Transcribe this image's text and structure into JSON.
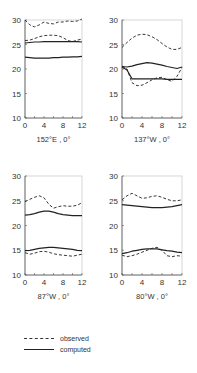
{
  "chart_data": [
    {
      "type": "line",
      "title": "152°E , 0°",
      "xlabel": "",
      "ylabel": "",
      "xlim": [
        0,
        12
      ],
      "ylim": [
        10,
        30
      ],
      "xticks": [
        0,
        4,
        8,
        12
      ],
      "yticks": [
        10,
        15,
        20,
        25,
        30
      ],
      "x": [
        0,
        1,
        2,
        3,
        4,
        5,
        6,
        7,
        8,
        9,
        10,
        11,
        12
      ],
      "series": [
        {
          "name": "observed",
          "style": "dashed",
          "values": [
            30.0,
            29.0,
            28.6,
            29.0,
            29.6,
            29.3,
            29.2,
            29.6,
            29.6,
            29.8,
            29.7,
            29.8,
            30.2
          ]
        },
        {
          "name": "observed",
          "style": "dashed",
          "values": [
            25.8,
            25.9,
            26.2,
            26.6,
            26.8,
            26.9,
            26.9,
            26.8,
            26.4,
            25.8,
            25.6,
            25.9,
            26.1
          ]
        },
        {
          "name": "computed",
          "style": "solid",
          "values": [
            25.3,
            25.4,
            25.5,
            25.5,
            25.6,
            25.6,
            25.6,
            25.6,
            25.6,
            25.6,
            25.6,
            25.6,
            25.5
          ]
        },
        {
          "name": "computed",
          "style": "solid",
          "values": [
            22.4,
            22.3,
            22.2,
            22.2,
            22.2,
            22.2,
            22.3,
            22.3,
            22.4,
            22.4,
            22.5,
            22.5,
            22.6
          ]
        }
      ]
    },
    {
      "type": "line",
      "title": "137°W , 0°",
      "xlabel": "",
      "ylabel": "",
      "xlim": [
        0,
        12
      ],
      "ylim": [
        10,
        30
      ],
      "xticks": [
        0,
        4,
        8,
        12
      ],
      "yticks": [
        10,
        15,
        20,
        25,
        30
      ],
      "x": [
        0,
        1,
        2,
        3,
        4,
        5,
        6,
        7,
        8,
        9,
        10,
        11,
        12
      ],
      "series": [
        {
          "name": "observed",
          "style": "dashed",
          "values": [
            24.4,
            25.4,
            26.3,
            26.9,
            27.1,
            27.0,
            26.6,
            26.0,
            25.2,
            24.5,
            24.0,
            24.0,
            24.4
          ]
        },
        {
          "name": "observed",
          "style": "dashed",
          "values": [
            20.6,
            20.0,
            17.2,
            16.6,
            16.7,
            17.2,
            17.8,
            18.2,
            18.3,
            17.8,
            17.5,
            18.5,
            20.3
          ]
        },
        {
          "name": "computed",
          "style": "solid",
          "values": [
            20.5,
            20.4,
            20.6,
            20.9,
            21.1,
            21.3,
            21.2,
            21.0,
            20.8,
            20.5,
            20.3,
            20.1,
            20.4
          ]
        },
        {
          "name": "computed",
          "style": "solid",
          "values": [
            20.4,
            19.8,
            18.0,
            18.0,
            18.0,
            18.0,
            18.0,
            18.0,
            18.0,
            17.9,
            17.9,
            17.9,
            17.9
          ]
        }
      ]
    },
    {
      "type": "line",
      "title": "87°W , 0°",
      "xlabel": "",
      "ylabel": "",
      "xlim": [
        0,
        12
      ],
      "ylim": [
        10,
        30
      ],
      "xticks": [
        0,
        4,
        8,
        12
      ],
      "yticks": [
        10,
        15,
        20,
        25,
        30
      ],
      "x": [
        0,
        1,
        2,
        3,
        4,
        5,
        6,
        7,
        8,
        9,
        10,
        11,
        12
      ],
      "series": [
        {
          "name": "observed",
          "style": "dashed",
          "values": [
            24.8,
            25.3,
            25.7,
            26.0,
            25.6,
            24.3,
            23.5,
            23.8,
            24.0,
            23.9,
            23.9,
            24.1,
            24.6
          ]
        },
        {
          "name": "computed",
          "style": "solid",
          "values": [
            22.1,
            22.2,
            22.4,
            22.7,
            22.9,
            22.9,
            22.7,
            22.4,
            22.2,
            22.1,
            22.0,
            22.0,
            22.0
          ]
        },
        {
          "name": "computed",
          "style": "solid",
          "values": [
            14.9,
            15.0,
            15.2,
            15.4,
            15.5,
            15.6,
            15.6,
            15.5,
            15.4,
            15.3,
            15.2,
            15.0,
            14.9
          ]
        },
        {
          "name": "observed",
          "style": "dashed",
          "values": [
            14.5,
            14.2,
            14.4,
            14.7,
            14.8,
            14.6,
            14.3,
            14.1,
            14.0,
            13.9,
            13.8,
            14.0,
            14.2
          ]
        }
      ]
    },
    {
      "type": "line",
      "title": "80°W , 0°",
      "xlabel": "",
      "ylabel": "",
      "xlim": [
        0,
        12
      ],
      "ylim": [
        10,
        30
      ],
      "xticks": [
        0,
        4,
        8,
        12
      ],
      "yticks": [
        10,
        15,
        20,
        25,
        30
      ],
      "x": [
        0,
        1,
        2,
        3,
        4,
        5,
        6,
        7,
        8,
        9,
        10,
        11,
        12
      ],
      "series": [
        {
          "name": "observed",
          "style": "dashed",
          "values": [
            25.2,
            26.0,
            26.5,
            26.0,
            25.5,
            25.6,
            25.9,
            26.0,
            25.7,
            25.3,
            25.0,
            25.0,
            25.2
          ]
        },
        {
          "name": "computed",
          "style": "solid",
          "values": [
            24.2,
            24.1,
            24.0,
            23.9,
            23.8,
            23.7,
            23.6,
            23.6,
            23.6,
            23.7,
            23.8,
            24.0,
            24.2
          ]
        },
        {
          "name": "computed",
          "style": "solid",
          "values": [
            14.3,
            14.5,
            14.8,
            15.0,
            15.2,
            15.3,
            15.3,
            15.3,
            15.1,
            14.9,
            14.8,
            14.6,
            14.5
          ]
        },
        {
          "name": "observed",
          "style": "dashed",
          "values": [
            14.0,
            13.7,
            13.9,
            14.2,
            14.6,
            15.0,
            15.4,
            15.6,
            15.0,
            13.9,
            13.7,
            13.9,
            13.8
          ]
        }
      ]
    }
  ],
  "legend": {
    "observed": "observed",
    "computed": "computed"
  },
  "colors": {
    "line": "#222222",
    "axis": "#555555",
    "text": "#333333"
  }
}
